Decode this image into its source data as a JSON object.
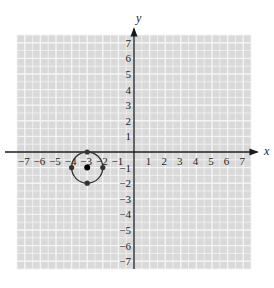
{
  "chart_data": {
    "type": "scatter",
    "title": "",
    "xlabel": "x",
    "ylabel": "y",
    "xlim": [
      -7,
      7
    ],
    "ylim": [
      -7,
      7
    ],
    "grid": true,
    "x_ticks": [
      -7,
      -6,
      -5,
      -4,
      -3,
      -2,
      -1,
      1,
      2,
      3,
      4,
      5,
      6,
      7
    ],
    "y_ticks": [
      -7,
      -6,
      -5,
      -4,
      -3,
      -2,
      -1,
      1,
      2,
      3,
      4,
      5,
      6,
      7
    ],
    "circle": {
      "center": [
        -3,
        -1
      ],
      "radius": 1
    },
    "points": [
      {
        "x": -3,
        "y": -1,
        "role": "center"
      },
      {
        "x": -3,
        "y": 0,
        "role": "on-circle"
      },
      {
        "x": -2,
        "y": -1,
        "role": "on-circle"
      },
      {
        "x": -3,
        "y": -2,
        "role": "on-circle"
      },
      {
        "x": -4,
        "y": -1,
        "role": "on-circle"
      }
    ],
    "colors": {
      "grid_bg": "#d9d9d9",
      "grid_line": "#f4f4f4",
      "axis": "#1a1a1a",
      "circle": "#333333",
      "point": "#333333"
    }
  }
}
